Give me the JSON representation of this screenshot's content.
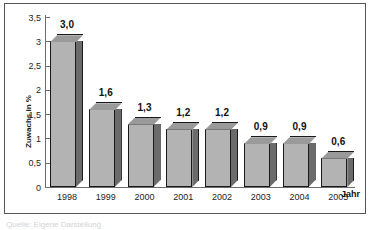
{
  "chart_data": {
    "type": "bar",
    "title": "",
    "subtitle": "",
    "xlabel": "Jahr",
    "ylabel": "Zuwachs in %",
    "categories": [
      "1998",
      "1999",
      "2000",
      "2001",
      "2002",
      "2003",
      "2004",
      "2005"
    ],
    "values": [
      3.0,
      1.6,
      1.3,
      1.2,
      1.2,
      0.9,
      0.9,
      0.6
    ],
    "value_labels": [
      "3,0",
      "1,6",
      "1,3",
      "1,2",
      "1,2",
      "0,9",
      "0,9",
      "0,6"
    ],
    "ylim": [
      0,
      3.5
    ],
    "y_ticks": [
      0,
      0.5,
      1,
      1.5,
      2,
      2.5,
      3,
      3.5
    ],
    "y_tick_labels": [
      "0",
      "0,5",
      "1",
      "1,5",
      "2",
      "2,5",
      "3",
      "3,5"
    ],
    "grid": false,
    "legend": null,
    "legend_position": "none",
    "style": "3d-bars-grayscale",
    "series": [
      {
        "name": "Zuwachs in %",
        "values": [
          3.0,
          1.6,
          1.3,
          1.2,
          1.2,
          0.9,
          0.9,
          0.6
        ]
      }
    ],
    "colors": {
      "bar_front": "#b3b3b3",
      "bar_side": "#6b6b6b",
      "bar_top": "#9a9a9a",
      "bar_outline": "#1a1a1a",
      "axis": "#6d6d6d",
      "text": "#1d1d1d",
      "frame": "#555555",
      "background": "#ffffff"
    }
  },
  "figure": {
    "caption": "Quelle: Eigene Darstellung"
  }
}
